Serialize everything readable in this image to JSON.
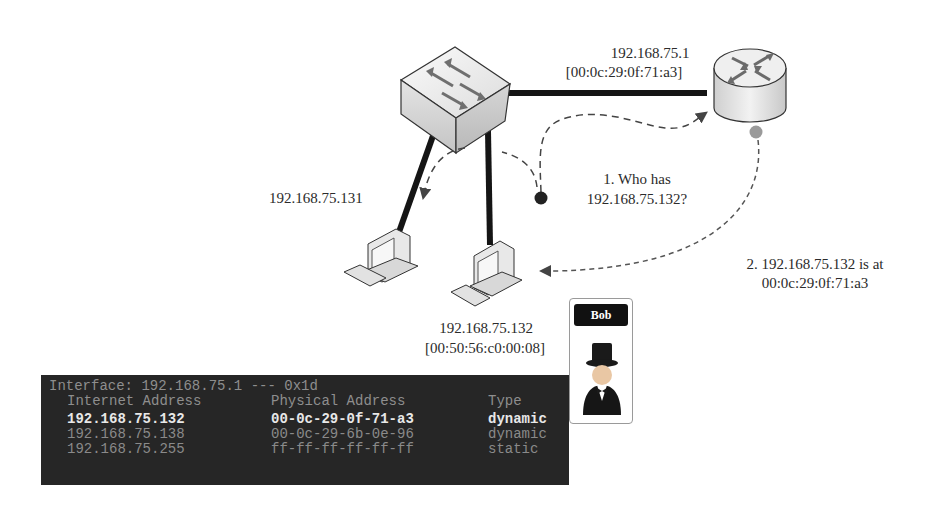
{
  "router": {
    "ip": "192.168.75.1",
    "mac": "[00:0c:29:0f:71:a3]"
  },
  "hosts": [
    {
      "ip": "192.168.75.131"
    },
    {
      "ip": "192.168.75.132",
      "mac": "[00:50:56:c0:00:08]"
    }
  ],
  "steps": {
    "step1_line1": "1. Who has",
    "step1_line2": "192.168.75.132?",
    "step2_line1": "2. 192.168.75.132 is at",
    "step2_line2": "00:0c:29:0f:71:a3"
  },
  "attacker": {
    "name": "Bob",
    "icon": "top-hat-person-icon"
  },
  "arp_table": {
    "interface_line": "Interface: 192.168.75.1 --- 0x1d",
    "headers": [
      "Internet Address",
      "Physical Address",
      "Type"
    ],
    "rows": [
      {
        "internet": "192.168.75.132",
        "physical": "00-0c-29-0f-71-a3",
        "type": "dynamic",
        "highlight": true
      },
      {
        "internet": "192.168.75.138",
        "physical": "00-0c-29-6b-0e-96",
        "type": "dynamic",
        "highlight": false
      },
      {
        "internet": "192.168.75.255",
        "physical": "ff-ff-ff-ff-ff-ff",
        "type": "static",
        "highlight": false
      }
    ]
  },
  "colors": {
    "terminal_bg": "#262626",
    "terminal_text": "#8e8e8e",
    "terminal_highlight": "#e8e8e8",
    "request_dot": "#222222",
    "reply_dot": "#9a9a9a"
  }
}
